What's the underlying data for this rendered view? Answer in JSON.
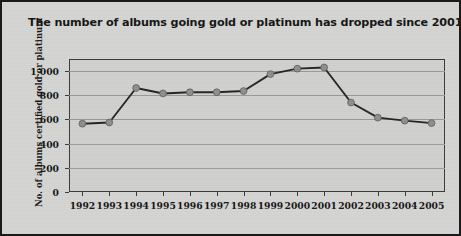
{
  "figure": {
    "title": "The number of albums going gold or platinum has dropped since 2001.",
    "background_color": "#d4d4d2",
    "border_color": "#1a1a1a"
  },
  "chart_data": {
    "type": "line",
    "title": "The number of albums going gold or platinum has dropped since 2001.",
    "xlabel": "",
    "ylabel": "No. of albums certified gold or platinum",
    "categories": [
      "1992",
      "1993",
      "1994",
      "1995",
      "1996",
      "1997",
      "1998",
      "1999",
      "2000",
      "2001",
      "2002",
      "2003",
      "2004",
      "2005"
    ],
    "values": [
      565,
      575,
      860,
      815,
      825,
      825,
      835,
      975,
      1020,
      1030,
      740,
      615,
      590,
      570
    ],
    "series": [
      {
        "name": "Albums certified gold or platinum",
        "values": [
          565,
          575,
          860,
          815,
          825,
          825,
          835,
          975,
          1020,
          1030,
          740,
          615,
          590,
          570
        ],
        "line_color": "#242424",
        "marker_color": "#8e8e8c"
      }
    ],
    "ylim": [
      0,
      1100
    ],
    "yticks": [
      0,
      200,
      400,
      600,
      800,
      1000
    ],
    "ytick_labels": [
      "0",
      "200",
      "400",
      "600",
      "800",
      "1,000"
    ],
    "grid": true,
    "grid_axis": "y",
    "legend": false,
    "legend_position": "none",
    "plot_background": "#d0d0ce",
    "grid_color": "#9a9a98",
    "axis_color": "#3b3b3b"
  }
}
